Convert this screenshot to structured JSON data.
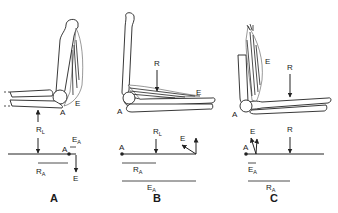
{
  "figure": {
    "panels": [
      {
        "id": "A",
        "label": "A",
        "arm_labels": {
          "fulcrum": "A",
          "effort": "E"
        },
        "lever_labels": {
          "fulcrum": "A",
          "resistance": "R",
          "resistance_sub": "L",
          "effort": "E",
          "effort_arm": "E",
          "effort_arm_sub": "A",
          "resistance_arm": "R",
          "resistance_arm_sub": "A"
        }
      },
      {
        "id": "B",
        "label": "B",
        "arm_labels": {
          "fulcrum": "A",
          "resistance": "R",
          "effort": "E"
        },
        "lever_labels": {
          "fulcrum": "A",
          "resistance": "R",
          "resistance_sub": "L",
          "effort": "E",
          "resistance_arm": "R",
          "resistance_arm_sub": "A",
          "effort_arm": "E",
          "effort_arm_sub": "A"
        }
      },
      {
        "id": "C",
        "label": "C",
        "arm_labels": {
          "fulcrum": "A",
          "resistance": "R",
          "effort": "E"
        },
        "lever_labels": {
          "fulcrum": "A",
          "resistance": "R",
          "effort": "E",
          "effort_arm": "E",
          "effort_arm_sub": "A",
          "resistance_arm": "R",
          "resistance_arm_sub": "A"
        }
      }
    ]
  }
}
